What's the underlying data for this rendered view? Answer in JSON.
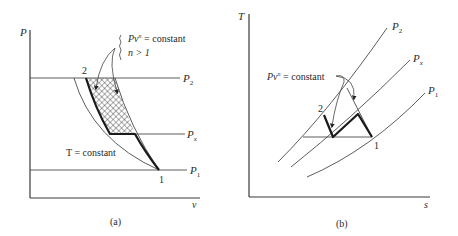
{
  "panel_a": {
    "caption": "(a)",
    "y_axis_label": "P",
    "x_axis_label": "v",
    "lines": {
      "p2": "P",
      "p2_sub": "2",
      "px": "P",
      "px_sub": "x",
      "p1": "P",
      "p1_sub": "1"
    },
    "points": {
      "state2": "2",
      "state1": "1"
    },
    "annotation": {
      "line1_prefix": "Pv",
      "line1_exp": "n",
      "line1_suffix": " = constant",
      "line2": "n > 1"
    },
    "isotherm_label": "T = constant"
  },
  "panel_b": {
    "caption": "(b)",
    "y_axis_label": "T",
    "x_axis_label": "s",
    "lines": {
      "p2": "P",
      "p2_sub": "2",
      "px": "P",
      "px_sub": "x",
      "p1": "P",
      "p1_sub": "1"
    },
    "points": {
      "state2": "2",
      "state1": "1"
    },
    "annotation": {
      "line1_prefix": "Pv",
      "line1_exp": "n",
      "line1_suffix": " = constant"
    }
  },
  "colors": {
    "ink": "#1a1a1a",
    "thin_line": "#4a4a4a",
    "background": "#ffffff"
  }
}
